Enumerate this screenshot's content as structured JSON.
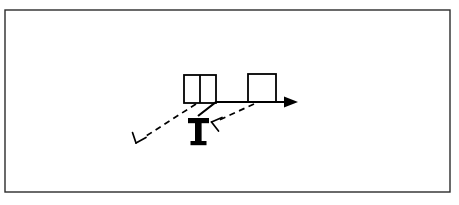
{
  "page": {
    "width": 459,
    "height": 205,
    "background_color": "#ffffff",
    "type": "line-art-technical-figure"
  },
  "frame": {
    "name": "outer-border-frame",
    "x": 5,
    "y": 10,
    "width": 445,
    "height": 182,
    "stroke_color": "#2b2b2b",
    "stroke_width": 1.4,
    "fill": "none"
  },
  "figure": {
    "stroke_color": "#000000",
    "fill_color": "#000000",
    "elements": {
      "divided_box": {
        "label": "divided-double-cell-box",
        "x": 184,
        "y": 75,
        "width": 32,
        "height": 28,
        "divider_x": 200,
        "stroke_width": 1.8
      },
      "single_box": {
        "label": "single-square-box",
        "x": 248,
        "y": 74,
        "width": 28,
        "height": 28,
        "stroke_width": 1.8
      },
      "t_shape": {
        "label": "bold-t-support",
        "cap_x": 188,
        "cap_y": 118,
        "cap_width": 21,
        "cap_height": 5,
        "stem_x": 195,
        "stem_y": 123,
        "stem_width": 6.5,
        "stem_height": 19,
        "foot_x": 190,
        "foot_y": 142,
        "foot_width": 17,
        "foot_height": 4
      },
      "solid_polyline": {
        "label": "solid-path-with-arrow",
        "points": "198,116 216,102 276,102 292,102",
        "stroke_width": 2.2,
        "arrow_tip_x": 298,
        "arrow_tip_y": 102,
        "arrow_back_x": 284,
        "arrow_half_height": 5.5
      },
      "dashed_line_left": {
        "label": "dashed-leader-left",
        "x1": 196,
        "y1": 104,
        "x2": 141,
        "y2": 139,
        "stroke_width": 1.7,
        "dash_pattern": "6,4.5"
      },
      "dashed_line_right": {
        "label": "dashed-leader-right",
        "x1": 253,
        "y1": 104,
        "x2": 216,
        "y2": 121,
        "stroke_width": 1.7,
        "dash_pattern": "6,4.5"
      },
      "open_arrowhead_left": {
        "label": "open-y-arrowhead-down-left",
        "tip_x": 135,
        "tip_y": 143,
        "barb_a_x": 132,
        "barb_a_y": 133,
        "barb_b_x": 145,
        "barb_b_y": 144,
        "stroke_width": 1.7
      },
      "open_arrowhead_right": {
        "label": "open-y-arrowhead-left",
        "tip_x": 211,
        "tip_y": 122,
        "barb_a_x": 221,
        "barb_a_y": 117,
        "barb_b_x": 219,
        "barb_b_y": 130,
        "stroke_width": 1.7
      }
    }
  },
  "caption": {
    "text": "",
    "visible": false,
    "note": "bottom edge text clipped and illegible"
  }
}
